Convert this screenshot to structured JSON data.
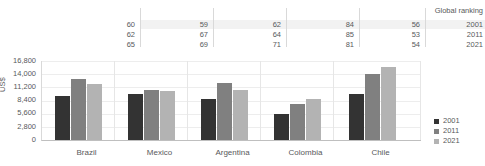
{
  "ranking_table": {
    "header_label": "Global ranking",
    "row_year_labels": [
      "2001",
      "2011",
      "2021"
    ],
    "countries": [
      "Brazil",
      "Mexico",
      "Argentina",
      "Colombia",
      "Chile"
    ],
    "values": [
      [
        60,
        59,
        62,
        84,
        56
      ],
      [
        62,
        67,
        64,
        85,
        53
      ],
      [
        65,
        69,
        71,
        81,
        54
      ]
    ]
  },
  "legend": {
    "items": [
      {
        "label": "2001",
        "color": "#333333"
      },
      {
        "label": "2011",
        "color": "#808080"
      },
      {
        "label": "2021",
        "color": "#b3b3b3"
      }
    ]
  },
  "axis": {
    "y_label": "US$",
    "y_ticks": [
      "16,800",
      "14,000",
      "11,200",
      "8,400",
      "5,600",
      "2,800",
      "0"
    ]
  },
  "chart_data": {
    "type": "bar",
    "title": "",
    "xlabel": "",
    "ylabel": "US$",
    "ylim": [
      0,
      16800
    ],
    "ytick_values": [
      0,
      2800,
      5600,
      8400,
      11200,
      14000,
      16800
    ],
    "grid": true,
    "legend_position": "bottom-right",
    "categories": [
      "Brazil",
      "Mexico",
      "Argentina",
      "Colombia",
      "Chile"
    ],
    "series": [
      {
        "name": "2001",
        "color": "#333333",
        "values": [
          9300,
          9800,
          8700,
          5600,
          9700
        ]
      },
      {
        "name": "2011",
        "color": "#808080",
        "values": [
          13000,
          10600,
          12200,
          7700,
          14100
        ]
      },
      {
        "name": "2021",
        "color": "#b3b3b3",
        "values": [
          12000,
          10400,
          10700,
          8800,
          15500
        ]
      }
    ],
    "annotations": {
      "global_ranking": {
        "label": "Global ranking",
        "rows": [
          "2001",
          "2011",
          "2021"
        ],
        "Brazil": [
          60,
          62,
          65
        ],
        "Mexico": [
          59,
          67,
          69
        ],
        "Argentina": [
          62,
          64,
          71
        ],
        "Colombia": [
          84,
          85,
          81
        ],
        "Chile": [
          56,
          53,
          54
        ]
      }
    }
  }
}
